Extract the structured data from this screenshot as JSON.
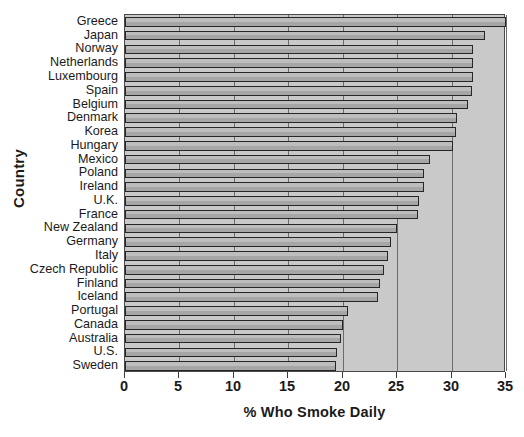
{
  "chart_data": {
    "type": "bar",
    "orientation": "horizontal",
    "title": "",
    "xlabel": "% Who Smoke Daily",
    "ylabel": "Country",
    "xlim": [
      0,
      35
    ],
    "xticks": [
      0,
      5,
      10,
      15,
      20,
      25,
      30,
      35
    ],
    "grid": true,
    "grid_axis": "x",
    "legend": null,
    "categories": [
      "Greece",
      "Japan",
      "Norway",
      "Netherlands",
      "Luxembourg",
      "Spain",
      "Belgium",
      "Denmark",
      "Korea",
      "Hungary",
      "Mexico",
      "Poland",
      "Ireland",
      "U.K.",
      "France",
      "New Zealand",
      "Germany",
      "Italy",
      "Czech Republic",
      "Finland",
      "Iceland",
      "Portugal",
      "Canada",
      "Australia",
      "U.S.",
      "Sweden"
    ],
    "values": [
      35.0,
      33.1,
      32.0,
      32.0,
      32.0,
      31.9,
      31.5,
      30.5,
      30.4,
      30.1,
      28.0,
      27.5,
      27.5,
      27.0,
      26.9,
      25.0,
      24.4,
      24.2,
      23.8,
      23.4,
      23.2,
      20.5,
      20.0,
      19.8,
      19.5,
      19.4
    ],
    "bar_color": "#b4b4b4",
    "plot_bg_color": "#c9c9c9",
    "axis_color": "#3a3a3a"
  }
}
